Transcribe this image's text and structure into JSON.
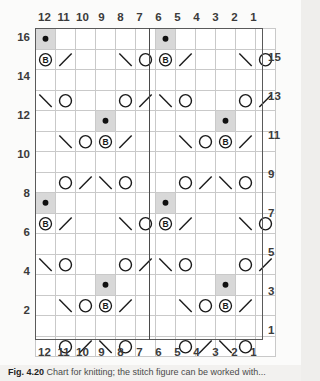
{
  "chart_data": {
    "type": "table",
    "xlabel": "Stitch number",
    "ylabel": "Row number",
    "columns": 12,
    "rows": 16,
    "column_labels": [
      "12",
      "11",
      "10",
      "9",
      "8",
      "7",
      "6",
      "5",
      "4",
      "3",
      "2",
      "1"
    ],
    "column_label_order": "right-to-left",
    "row_labels_left": [
      "16",
      "14",
      "12",
      "10",
      "8",
      "6",
      "4",
      "2"
    ],
    "row_labels_right": [
      "15",
      "13",
      "11",
      "9",
      "7",
      "5",
      "3",
      "1"
    ],
    "legend_symbols": {
      "blank": "knit",
      "O": "yarn over",
      "/": "k2tog",
      "\\": "ssk",
      "B": "bobble",
      "dot": "purl"
    },
    "repeat_marker_after_column": 7,
    "grid": true,
    "shaded_color": "#d8d8d8",
    "grid_line_color": "#c9c9c9",
    "border_color": "#5a5a5a",
    "cells": [
      {
        "row": 16,
        "col": 12,
        "symbol": "dot",
        "shaded": true
      },
      {
        "row": 16,
        "col": 6,
        "symbol": "dot",
        "shaded": true
      },
      {
        "row": 15,
        "col": 12,
        "symbol": "B",
        "shaded": false
      },
      {
        "row": 15,
        "col": 11,
        "symbol": "/",
        "shaded": false
      },
      {
        "row": 15,
        "col": 8,
        "symbol": "\\",
        "shaded": false
      },
      {
        "row": 15,
        "col": 7,
        "symbol": "O",
        "shaded": false
      },
      {
        "row": 15,
        "col": 6,
        "symbol": "B",
        "shaded": false
      },
      {
        "row": 15,
        "col": 5,
        "symbol": "/",
        "shaded": false
      },
      {
        "row": 15,
        "col": 2,
        "symbol": "\\",
        "shaded": false
      },
      {
        "row": 15,
        "col": 1,
        "symbol": "O",
        "shaded": false
      },
      {
        "row": 13,
        "col": 12,
        "symbol": "\\",
        "shaded": false
      },
      {
        "row": 13,
        "col": 11,
        "symbol": "O",
        "shaded": false
      },
      {
        "row": 13,
        "col": 8,
        "symbol": "O",
        "shaded": false
      },
      {
        "row": 13,
        "col": 7,
        "symbol": "/",
        "shaded": false
      },
      {
        "row": 13,
        "col": 6,
        "symbol": "\\",
        "shaded": false
      },
      {
        "row": 13,
        "col": 5,
        "symbol": "O",
        "shaded": false
      },
      {
        "row": 13,
        "col": 2,
        "symbol": "O",
        "shaded": false
      },
      {
        "row": 13,
        "col": 1,
        "symbol": "/",
        "shaded": false
      },
      {
        "row": 12,
        "col": 9,
        "symbol": "dot",
        "shaded": true
      },
      {
        "row": 12,
        "col": 3,
        "symbol": "dot",
        "shaded": true
      },
      {
        "row": 11,
        "col": 11,
        "symbol": "\\",
        "shaded": false
      },
      {
        "row": 11,
        "col": 10,
        "symbol": "O",
        "shaded": false
      },
      {
        "row": 11,
        "col": 9,
        "symbol": "B",
        "shaded": false
      },
      {
        "row": 11,
        "col": 8,
        "symbol": "/",
        "shaded": false
      },
      {
        "row": 11,
        "col": 5,
        "symbol": "\\",
        "shaded": false
      },
      {
        "row": 11,
        "col": 4,
        "symbol": "O",
        "shaded": false
      },
      {
        "row": 11,
        "col": 3,
        "symbol": "B",
        "shaded": false
      },
      {
        "row": 11,
        "col": 2,
        "symbol": "/",
        "shaded": false
      },
      {
        "row": 9,
        "col": 11,
        "symbol": "O",
        "shaded": false
      },
      {
        "row": 9,
        "col": 10,
        "symbol": "/",
        "shaded": false
      },
      {
        "row": 9,
        "col": 9,
        "symbol": "\\",
        "shaded": false
      },
      {
        "row": 9,
        "col": 8,
        "symbol": "O",
        "shaded": false
      },
      {
        "row": 9,
        "col": 5,
        "symbol": "O",
        "shaded": false
      },
      {
        "row": 9,
        "col": 4,
        "symbol": "/",
        "shaded": false
      },
      {
        "row": 9,
        "col": 3,
        "symbol": "\\",
        "shaded": false
      },
      {
        "row": 9,
        "col": 2,
        "symbol": "O",
        "shaded": false
      },
      {
        "row": 8,
        "col": 12,
        "symbol": "dot",
        "shaded": true
      },
      {
        "row": 8,
        "col": 6,
        "symbol": "dot",
        "shaded": true
      },
      {
        "row": 7,
        "col": 12,
        "symbol": "B",
        "shaded": false
      },
      {
        "row": 7,
        "col": 11,
        "symbol": "/",
        "shaded": false
      },
      {
        "row": 7,
        "col": 8,
        "symbol": "\\",
        "shaded": false
      },
      {
        "row": 7,
        "col": 7,
        "symbol": "O",
        "shaded": false
      },
      {
        "row": 7,
        "col": 6,
        "symbol": "B",
        "shaded": false
      },
      {
        "row": 7,
        "col": 5,
        "symbol": "/",
        "shaded": false
      },
      {
        "row": 7,
        "col": 2,
        "symbol": "\\",
        "shaded": false
      },
      {
        "row": 7,
        "col": 1,
        "symbol": "O",
        "shaded": false
      },
      {
        "row": 5,
        "col": 12,
        "symbol": "\\",
        "shaded": false
      },
      {
        "row": 5,
        "col": 11,
        "symbol": "O",
        "shaded": false
      },
      {
        "row": 5,
        "col": 8,
        "symbol": "O",
        "shaded": false
      },
      {
        "row": 5,
        "col": 7,
        "symbol": "/",
        "shaded": false
      },
      {
        "row": 5,
        "col": 6,
        "symbol": "\\",
        "shaded": false
      },
      {
        "row": 5,
        "col": 5,
        "symbol": "O",
        "shaded": false
      },
      {
        "row": 5,
        "col": 2,
        "symbol": "O",
        "shaded": false
      },
      {
        "row": 5,
        "col": 1,
        "symbol": "/",
        "shaded": false
      },
      {
        "row": 4,
        "col": 9,
        "symbol": "dot",
        "shaded": true
      },
      {
        "row": 4,
        "col": 3,
        "symbol": "dot",
        "shaded": true
      },
      {
        "row": 3,
        "col": 11,
        "symbol": "\\",
        "shaded": false
      },
      {
        "row": 3,
        "col": 10,
        "symbol": "O",
        "shaded": false
      },
      {
        "row": 3,
        "col": 9,
        "symbol": "B",
        "shaded": false
      },
      {
        "row": 3,
        "col": 8,
        "symbol": "/",
        "shaded": false
      },
      {
        "row": 3,
        "col": 5,
        "symbol": "\\",
        "shaded": false
      },
      {
        "row": 3,
        "col": 4,
        "symbol": "O",
        "shaded": false
      },
      {
        "row": 3,
        "col": 3,
        "symbol": "B",
        "shaded": false
      },
      {
        "row": 3,
        "col": 2,
        "symbol": "/",
        "shaded": false
      },
      {
        "row": 1,
        "col": 11,
        "symbol": "O",
        "shaded": false
      },
      {
        "row": 1,
        "col": 10,
        "symbol": "/",
        "shaded": false
      },
      {
        "row": 1,
        "col": 9,
        "symbol": "\\",
        "shaded": false
      },
      {
        "row": 1,
        "col": 8,
        "symbol": "O",
        "shaded": false
      },
      {
        "row": 1,
        "col": 5,
        "symbol": "O",
        "shaded": false
      },
      {
        "row": 1,
        "col": 4,
        "symbol": "/",
        "shaded": false
      },
      {
        "row": 1,
        "col": 3,
        "symbol": "\\",
        "shaded": false
      },
      {
        "row": 1,
        "col": 2,
        "symbol": "O",
        "shaded": false
      }
    ]
  },
  "caption": {
    "figure_label": "Fig. 4.20",
    "text": "Chart for knitting; the stitch figure can be worked with..."
  }
}
